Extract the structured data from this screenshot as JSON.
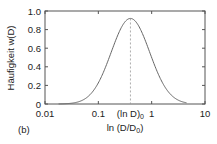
{
  "chart_data": {
    "type": "line",
    "title": "",
    "panel_label": "(b)",
    "xlabel": "ln (D/D0)",
    "xlabel_parts": {
      "main": "ln (D/D",
      "sub": "0",
      "close": ")"
    },
    "ylabel": "Häufigkeit w(D)",
    "xscale": "log",
    "xlim": [
      0.01,
      10
    ],
    "ylim": [
      0,
      1.0
    ],
    "grid": false,
    "x_ticks": [
      {
        "value": 0.01,
        "label": "0.01"
      },
      {
        "value": 0.1,
        "label": "0.1"
      },
      {
        "value": 1,
        "label": "1"
      },
      {
        "value": 10,
        "label": "10"
      }
    ],
    "y_ticks": [
      {
        "value": 0,
        "label": "0"
      },
      {
        "value": 0.2,
        "label": "0.2"
      },
      {
        "value": 0.4,
        "label": "0.4"
      },
      {
        "value": 0.6,
        "label": "0.6"
      },
      {
        "value": 0.8,
        "label": "0.8"
      },
      {
        "value": 1.0,
        "label": "1.0"
      }
    ],
    "annotation": {
      "x": 0.4,
      "label_main": "(ln D)",
      "label_sub": "0",
      "style": "dashed vertical line at peak"
    },
    "series": [
      {
        "name": "w(D)",
        "distribution": "log-normal",
        "peak_x": 0.4,
        "peak_y": 0.92,
        "sigma_decades": 0.36,
        "x": [
          0.02,
          0.03,
          0.05,
          0.07,
          0.1,
          0.15,
          0.2,
          0.3,
          0.4,
          0.5,
          0.7,
          1.0,
          1.5,
          2.0,
          3.0,
          4.0
        ],
        "values": [
          0.0,
          0.01,
          0.04,
          0.09,
          0.18,
          0.36,
          0.55,
          0.84,
          0.92,
          0.89,
          0.71,
          0.44,
          0.2,
          0.1,
          0.02,
          0.0
        ]
      }
    ]
  },
  "colors": {
    "axis": "#555555",
    "curve": "#666666",
    "dashed": "#999999",
    "text": "#222222"
  }
}
